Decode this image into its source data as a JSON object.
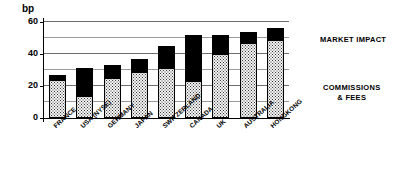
{
  "chart_data": {
    "type": "bar",
    "subtype": "stacked-vertical",
    "title": "",
    "xlabel": "",
    "ylabel": "bp",
    "ylim": [
      0,
      60
    ],
    "yticks": [
      0,
      20,
      40,
      60
    ],
    "minor_gridlines": [
      10,
      30,
      50
    ],
    "grid": true,
    "legend_position": "right",
    "categories": [
      "FRANCE",
      "USA (NYSE)",
      "GERMANY",
      "JAPAN",
      "SWITZERLAND",
      "CANADA",
      "UK",
      "AUSTRALIA",
      "HONGKONG"
    ],
    "series": [
      {
        "name": "COMMISSIONS & FEES",
        "color": "#f2f2f2",
        "values": [
          24,
          14,
          25,
          29,
          31,
          23,
          40,
          47,
          49
        ]
      },
      {
        "name": "MARKET IMPACT",
        "color": "#000000",
        "values": [
          3,
          17,
          8,
          8,
          14,
          29,
          12,
          7,
          7
        ]
      }
    ],
    "totals": [
      27,
      31,
      33,
      37,
      45,
      52,
      52,
      54,
      56
    ]
  },
  "axis": {
    "y_unit": "bp",
    "tick_labels": [
      "60",
      "40",
      "20",
      "0"
    ]
  },
  "legend": {
    "market_impact": "MARKET IMPACT",
    "commissions_line1": "COMMISSIONS",
    "commissions_line2": "&amp; FEES"
  }
}
